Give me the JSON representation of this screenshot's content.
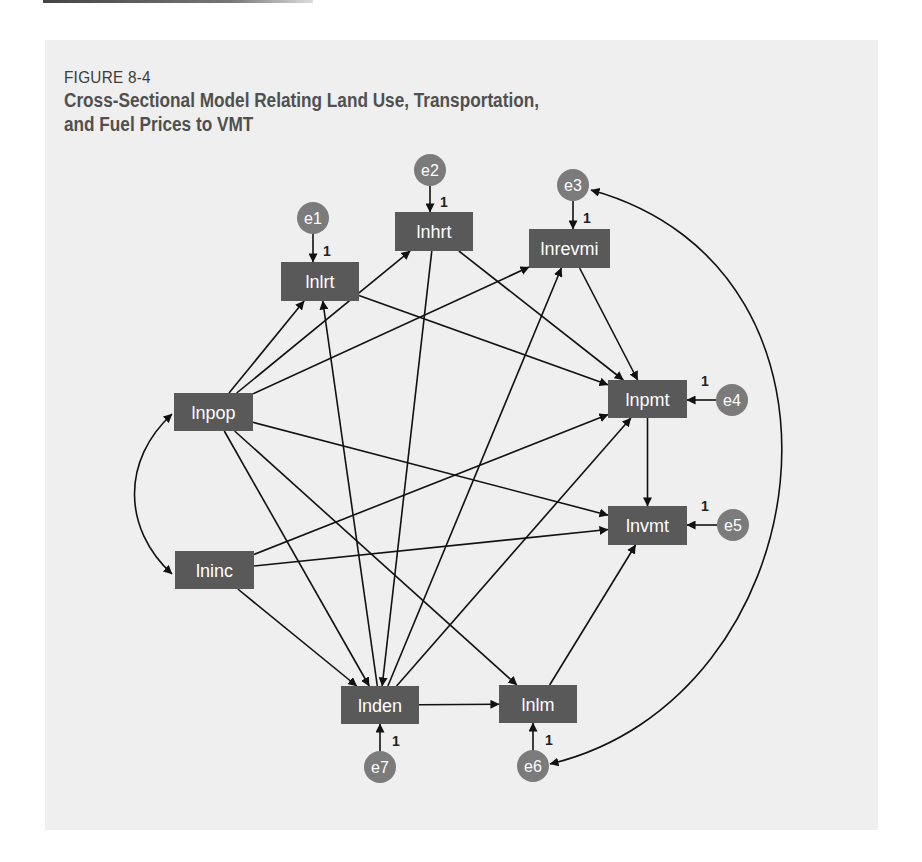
{
  "figure": {
    "number": "FIGURE 8-4",
    "title_line1": "Cross-Sectional Model Relating Land Use, Transportation,",
    "title_line2": "and Fuel Prices to VMT"
  },
  "colors": {
    "panel_bg": "#efefef",
    "node_fill": "#595959",
    "error_fill": "#7b7b7b",
    "edge": "#111111",
    "title": "#505050"
  },
  "nodes": [
    {
      "id": "lnlrt",
      "label": "lnlrt",
      "x": 281,
      "y": 262,
      "w": 78,
      "h": 39
    },
    {
      "id": "lnhrt",
      "label": "lnhrt",
      "x": 395,
      "y": 212,
      "w": 78,
      "h": 39
    },
    {
      "id": "lnrevmi",
      "label": "lnrevmi",
      "x": 529,
      "y": 229,
      "w": 81,
      "h": 39
    },
    {
      "id": "lnpop",
      "label": "lnpop",
      "x": 174,
      "y": 393,
      "w": 79,
      "h": 38
    },
    {
      "id": "lnpmt",
      "label": "lnpmt",
      "x": 608,
      "y": 380,
      "w": 79,
      "h": 38
    },
    {
      "id": "lnvmt",
      "label": "lnvmt",
      "x": 608,
      "y": 506,
      "w": 79,
      "h": 39
    },
    {
      "id": "lninc",
      "label": "lninc",
      "x": 175,
      "y": 551,
      "w": 79,
      "h": 38
    },
    {
      "id": "lnden",
      "label": "lnden",
      "x": 341,
      "y": 686,
      "w": 78,
      "h": 38
    },
    {
      "id": "lnlm",
      "label": "lnlm",
      "x": 499,
      "y": 685,
      "w": 78,
      "h": 38
    }
  ],
  "errors": [
    {
      "id": "e1",
      "label": "e1",
      "cx": 313,
      "cy": 218,
      "target": "lnlrt",
      "coef": "1"
    },
    {
      "id": "e2",
      "label": "e2",
      "cx": 430,
      "cy": 170,
      "target": "lnhrt",
      "coef": "1"
    },
    {
      "id": "e3",
      "label": "e3",
      "cx": 573,
      "cy": 185,
      "target": "lnrevmi",
      "coef": "1"
    },
    {
      "id": "e4",
      "label": "e4",
      "cx": 732,
      "cy": 400,
      "target": "lnpmt",
      "coef": "1"
    },
    {
      "id": "e5",
      "label": "e5",
      "cx": 733,
      "cy": 525,
      "target": "lnvmt",
      "coef": "1"
    },
    {
      "id": "e6",
      "label": "e6",
      "cx": 533,
      "cy": 766,
      "target": "lnlm",
      "coef": "1"
    },
    {
      "id": "e7",
      "label": "e7",
      "cx": 380,
      "cy": 767,
      "target": "lnden",
      "coef": "1"
    }
  ],
  "edges": [
    {
      "from": "lnpop",
      "to": "lnlrt"
    },
    {
      "from": "lnpop",
      "to": "lnhrt"
    },
    {
      "from": "lnpop",
      "to": "lnrevmi"
    },
    {
      "from": "lnpop",
      "to": "lnvmt"
    },
    {
      "from": "lnpop",
      "to": "lnden"
    },
    {
      "from": "lnpop",
      "to": "lnlm"
    },
    {
      "from": "lninc",
      "to": "lnpmt"
    },
    {
      "from": "lninc",
      "to": "lnvmt"
    },
    {
      "from": "lninc",
      "to": "lnden"
    },
    {
      "from": "lnden",
      "to": "lnlrt"
    },
    {
      "from": "lnhrt",
      "to": "lnden"
    },
    {
      "from": "lnden",
      "to": "lnrevmi"
    },
    {
      "from": "lnden",
      "to": "lnpmt"
    },
    {
      "from": "lnden",
      "to": "lnlm"
    },
    {
      "from": "lnlrt",
      "to": "lnpmt"
    },
    {
      "from": "lnhrt",
      "to": "lnpmt"
    },
    {
      "from": "lnrevmi",
      "to": "lnpmt"
    },
    {
      "from": "lnpmt",
      "to": "lnvmt"
    },
    {
      "from": "lnlm",
      "to": "lnvmt"
    }
  ],
  "covariances": [
    {
      "between": [
        "lnpop",
        "lninc"
      ]
    },
    {
      "between": [
        "e3",
        "e6"
      ]
    }
  ]
}
